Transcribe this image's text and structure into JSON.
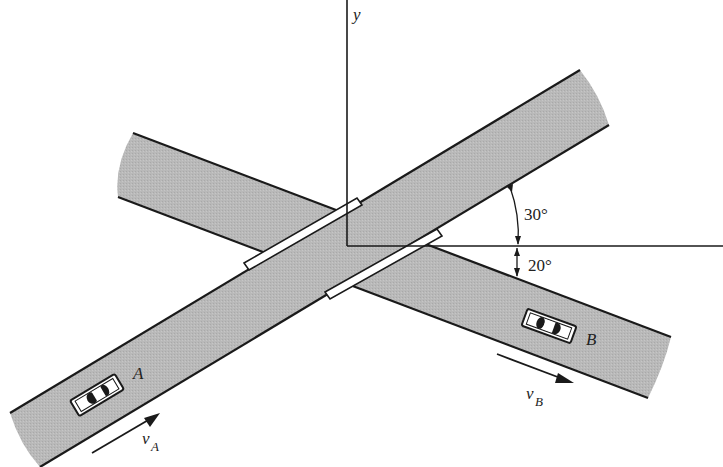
{
  "figure": {
    "axes": {
      "x_label": "",
      "y_label": "y"
    },
    "angles": {
      "road_a_angle": "30°",
      "road_b_angle": "20°"
    },
    "cars": {
      "a": {
        "label": "A",
        "velocity_label": "v",
        "velocity_sub": "A"
      },
      "b": {
        "label": "B",
        "velocity_label": "v",
        "velocity_sub": "B"
      }
    },
    "colors": {
      "road_fill": "#b8b8b8",
      "edge": "#1a1a1a",
      "background": "#ffffff"
    }
  }
}
